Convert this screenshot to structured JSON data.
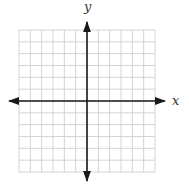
{
  "diagram": {
    "type": "coordinate-plane",
    "x_axis_label": "x",
    "y_axis_label": "y",
    "grid": {
      "columns": 12,
      "rows": 12,
      "columns_left_of_origin": 6,
      "rows_above_origin": 6
    },
    "colors": {
      "grid_line": "#cfcfcf",
      "axis": "#1a1a1a",
      "label": "#333333",
      "background": "#ffffff"
    }
  }
}
